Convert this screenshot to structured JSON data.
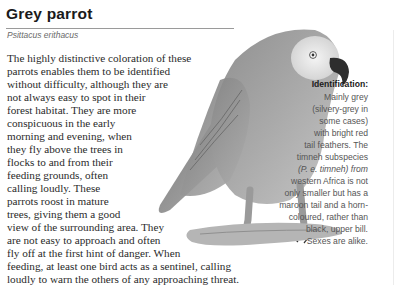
{
  "header": {
    "title": "Grey parrot",
    "scientific_name": "Psittacus erithacus"
  },
  "body": {
    "lines": [
      "The highly distinctive coloration of these",
      "parrots enables them to be identified",
      "without difficulty, although they are",
      "not always easy to spot in their",
      "forest habitat. They are more",
      "conspicuous in the early",
      "morning and evening, when",
      "they fly above the trees in",
      "flocks to and from their",
      "feeding grounds, often",
      "calling loudly. These",
      "parrots roost in mature",
      "trees, giving them a good",
      "view of the surrounding area. They",
      "are not easy to approach and often",
      "fly off at the first hint of danger. When",
      "feeding, at least one bird acts as a sentinel, calling",
      "loudly to warn the others of any approaching threat."
    ]
  },
  "identification": {
    "heading": "Identification:",
    "lines": [
      "Mainly grey",
      "(silvery-grey in",
      "some cases)",
      "with bright red",
      "tail feathers. The",
      "timneh subspecies",
      "(P. e. timneh) from",
      "western Africa is not",
      "only smaller but has a",
      "maroon tail and a horn-",
      "coloured, rather than",
      "black, upper bill.",
      "Sexes are alike."
    ]
  },
  "illustration": {
    "subject": "grey-parrot-perched-on-branch",
    "colors": {
      "body": "#9a9a9a",
      "face": "#ececec",
      "beak": "#2a2a2a",
      "branch": "#b5b5b5"
    }
  }
}
